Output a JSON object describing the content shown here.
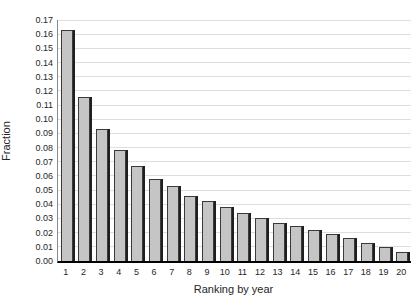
{
  "chart_data": {
    "type": "bar",
    "xlabel": "Ranking by year",
    "ylabel": "Fraction",
    "categories": [
      "1",
      "2",
      "3",
      "4",
      "5",
      "6",
      "7",
      "8",
      "9",
      "10",
      "11",
      "12",
      "13",
      "14",
      "15",
      "16",
      "17",
      "18",
      "19",
      "20"
    ],
    "values": [
      0.163,
      0.116,
      0.093,
      0.078,
      0.067,
      0.058,
      0.053,
      0.046,
      0.042,
      0.038,
      0.034,
      0.03,
      0.027,
      0.025,
      0.022,
      0.019,
      0.016,
      0.013,
      0.01,
      0.006
    ],
    "ylim": [
      0,
      0.17
    ],
    "ytick_step": 0.01,
    "ytick_format_decimals": 2,
    "grid": "horizontal",
    "legend": "none",
    "colors": {
      "bar_fill": "#c5c5c5",
      "bar_border": "#3a3a3a",
      "bar_shadow": "#1f1f1f",
      "gridline": "#dedede",
      "x_axis": "#000000",
      "y_axis": "#8a8a8a",
      "text": "#262626",
      "background": "#ffffff"
    }
  }
}
